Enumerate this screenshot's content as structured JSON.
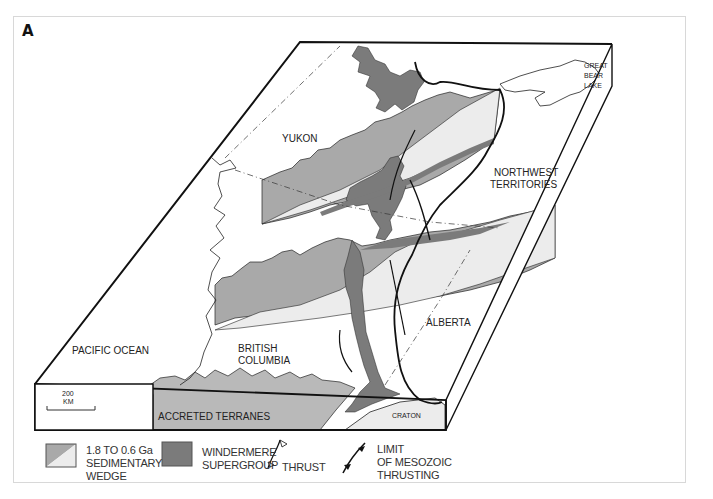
{
  "figure": {
    "panel_label": "A"
  },
  "map_labels": {
    "yukon": "YUKON",
    "northwest_territories_1": "NORTHWEST",
    "northwest_territories_2": "TERRITORIES",
    "great_bear_lake_1": "GREAT",
    "great_bear_lake_2": "BEAR",
    "great_bear_lake_3": "LAKE",
    "pacific_ocean": "PACIFIC OCEAN",
    "british_columbia_1": "BRITISH",
    "british_columbia_2": "COLUMBIA",
    "alberta": "ALBERTA",
    "accreted_terranes": "ACCRETED TERRANES",
    "craton": "CRATON"
  },
  "scale_bar": {
    "value": "200",
    "unit": "KM"
  },
  "legend": {
    "sedimentary_wedge": {
      "line1": "1.8 TO 0.6 Ga",
      "line2": "SEDIMENTARY",
      "line3": "WEDGE"
    },
    "windermere": {
      "line1": "WINDERMERE",
      "line2": "SUPERGROUP"
    },
    "thrust": {
      "label": "THRUST"
    },
    "mesozoic_limit": {
      "line1": "LIMIT",
      "line2": "OF MESOZOIC",
      "line3": "THRUSTING"
    }
  },
  "colors": {
    "wedge_dark": "#a9a9a9",
    "wedge_light": "#e9e9e9",
    "windermere": "#7b7b7b",
    "accreted": "#b9b9b9",
    "craton": "#ececec",
    "outline": "#111111"
  }
}
